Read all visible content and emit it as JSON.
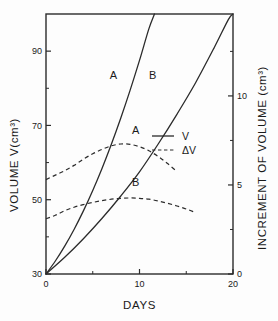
{
  "chart_data": {
    "type": "line",
    "title": "",
    "xlabel": "DAYS",
    "ylabel": "VOLUME V(cm³)",
    "y2label": "INCREMENT OF VOLUME (cm³)",
    "xlim": [
      0,
      20
    ],
    "ylim": [
      30,
      100
    ],
    "y2lim": [
      0,
      14.6
    ],
    "grid": false,
    "legend_position": "center-right",
    "x_ticks": [
      0,
      10,
      20
    ],
    "x_tick_labels": [
      "0",
      "10",
      "20"
    ],
    "x_minor_ticks": [
      5,
      15
    ],
    "y_ticks": [
      30,
      50,
      70,
      90
    ],
    "y_tick_labels": [
      "30",
      "50",
      "70",
      "90"
    ],
    "y_minor_ticks": [
      40,
      60,
      80
    ],
    "y2_ticks": [
      0,
      5,
      10
    ],
    "y2_tick_labels": [
      "0",
      "5",
      "10"
    ],
    "y2_minor_ticks": [
      2.5,
      7.5,
      12.5
    ],
    "legend": [
      {
        "label": "V",
        "style": "solid"
      },
      {
        "label": "ΔV",
        "style": "dashed"
      }
    ],
    "series": [
      {
        "name": "A",
        "axis": "left",
        "style": "solid",
        "label": "A",
        "label_x": 7.2,
        "label_y": 82.5,
        "x": [
          0,
          1,
          2,
          3,
          4,
          5,
          6,
          7,
          8,
          9,
          10,
          11,
          11.6
        ],
        "y": [
          30,
          33.5,
          37.5,
          42,
          47,
          52.5,
          58.5,
          65,
          72,
          79.5,
          87.5,
          96,
          100
        ]
      },
      {
        "name": "B",
        "axis": "left",
        "style": "solid",
        "label": "B",
        "label_x": 11.4,
        "label_y": 82.5,
        "x": [
          0,
          2,
          4,
          6,
          8,
          10,
          12,
          14,
          16,
          18,
          19.5,
          20
        ],
        "y": [
          30,
          34.5,
          39.5,
          45,
          51,
          57.5,
          65,
          73,
          81.5,
          91,
          98.5,
          100
        ]
      },
      {
        "name": "A",
        "axis": "right",
        "style": "dashed",
        "label": "A",
        "label_x": 9.6,
        "label_y": 7.85,
        "x": [
          0,
          1,
          2,
          3,
          4,
          5,
          6,
          7,
          8,
          9,
          10,
          11,
          12,
          13,
          14
        ],
        "y": [
          5.3,
          5.55,
          5.8,
          6.1,
          6.45,
          6.75,
          7.0,
          7.2,
          7.3,
          7.28,
          7.15,
          6.92,
          6.6,
          6.2,
          5.75
        ]
      },
      {
        "name": "B",
        "axis": "right",
        "style": "dashed",
        "label": "B",
        "label_x": 9.6,
        "label_y": 4.95,
        "x": [
          0,
          1,
          2,
          3,
          4,
          5,
          6,
          7,
          8,
          9,
          10,
          11,
          12,
          13,
          14,
          15,
          16
        ],
        "y": [
          3.1,
          3.3,
          3.55,
          3.75,
          3.9,
          4.02,
          4.12,
          4.2,
          4.25,
          4.27,
          4.25,
          4.2,
          4.1,
          3.97,
          3.82,
          3.65,
          3.45
        ]
      }
    ]
  }
}
